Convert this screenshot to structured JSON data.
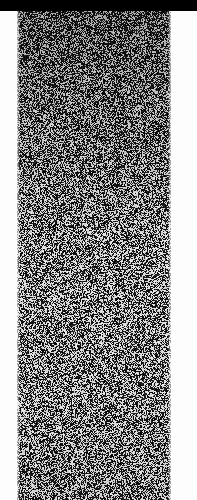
{
  "image": {
    "kind": "noise-scan-fragment",
    "width": 197,
    "height": 500,
    "background_color": "#fdfdfd",
    "description": "Narrow vertical strip of dense black-and-white speckle noise on white paper, capped by a solid black bar along the top edge."
  },
  "top_bar": {
    "name": "black-header-bar",
    "color": "#000000",
    "x": 0,
    "y": 0,
    "width": 197,
    "height": 11,
    "spans_full_width": true
  },
  "noise_field": {
    "name": "speckle-noise-field",
    "x": 17,
    "y": 11,
    "width": 154,
    "height": 489,
    "runs_off_bottom_edge": true,
    "dark_color": "#000000",
    "light_color": "#f2f2f2",
    "base_color": "#111111",
    "grain_pixel_size": 1,
    "black_ratio": 0.52,
    "upper_region_darker": true,
    "texture_type": "random-dither-speckle"
  },
  "margins": {
    "left": {
      "name": "left-paper-margin",
      "x": 0,
      "width": 17,
      "color": "#fdfdfd"
    },
    "right": {
      "name": "right-paper-margin",
      "x": 171,
      "width": 26,
      "color": "#fdfdfd"
    }
  },
  "text_content": {
    "readable_text_present": false,
    "note": "No legible text, labels, controls or chart elements are rendered in this image."
  }
}
